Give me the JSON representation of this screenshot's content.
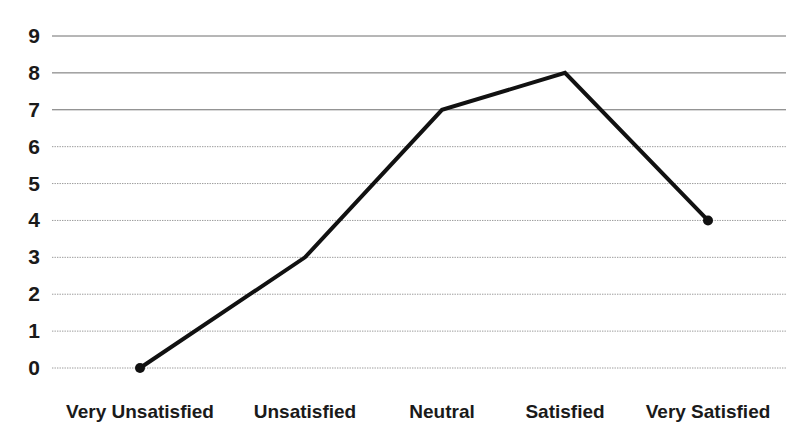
{
  "chart_data": {
    "type": "line",
    "title": "",
    "subtitle": "",
    "xlabel": "",
    "ylabel": "",
    "categories": [
      "Very Unsatisfied",
      "Unsatisfied",
      "Neutral",
      "Satisfied",
      "Very Satisfied"
    ],
    "values": [
      0,
      3,
      7,
      8,
      4
    ],
    "series": [
      {
        "name": "Responses",
        "values": [
          0,
          3,
          7,
          8,
          4
        ]
      }
    ],
    "ylim": [
      0,
      9
    ],
    "y_ticks": [
      0,
      1,
      2,
      3,
      4,
      5,
      6,
      7,
      8,
      9
    ],
    "y_tick_labels": [
      "0",
      "1",
      "2",
      "3",
      "4",
      "5",
      "6",
      "7",
      "8",
      "9"
    ],
    "grid": true,
    "grid_axis": "y",
    "legend": false,
    "legend_position": "none",
    "markers": true,
    "annotations": [],
    "colors": {
      "line": "#111111",
      "marker": "#111111",
      "grid": "#9a9a9a",
      "grid_strong": "#6e6e6e",
      "text": "#1a1a1a",
      "background": "#ffffff"
    },
    "style": {
      "line_width_px": 4,
      "marker_radius_px": 5,
      "grid_line_width_px": 1
    }
  },
  "axes": {
    "y_axis_name": "value-axis",
    "x_axis_name": "category-axis"
  }
}
